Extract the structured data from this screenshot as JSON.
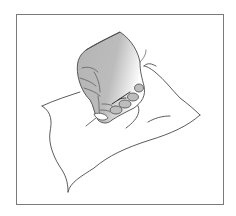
{
  "illustration": {
    "subject": "hand-scrunching-cloth",
    "colors": {
      "frame": "#7a7a7a",
      "line": "#4a4a4a",
      "hand_fill": "#b8b8b8",
      "hand_highlight": "#ffffff",
      "background": "#ffffff"
    }
  }
}
